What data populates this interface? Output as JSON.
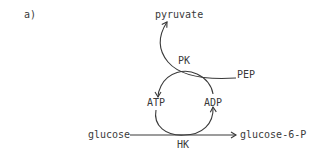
{
  "panel": {
    "label": "a)"
  },
  "nodes": {
    "pyruvate": "pyruvate",
    "pep": "PEP",
    "atp": "ATP",
    "adp": "ADP",
    "glucose": "glucose",
    "glucose6p": "glucose-6-P"
  },
  "enzymes": {
    "pk": "PK",
    "hk": "HK"
  },
  "edges": [
    {
      "from": "PEP",
      "to": "pyruvate",
      "enzyme": "PK"
    },
    {
      "from": "glucose",
      "to": "glucose-6-P",
      "enzyme": "HK"
    },
    {
      "from": "ADP",
      "to": "ATP",
      "via": "PK"
    },
    {
      "from": "ATP",
      "to": "ADP",
      "via": "HK"
    }
  ],
  "colors": {
    "ink": "#3a3a3a",
    "background": "#ffffff"
  }
}
